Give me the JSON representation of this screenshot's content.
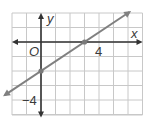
{
  "chart_data": {
    "type": "line",
    "title": "",
    "xlabel": "x",
    "ylabel": "y",
    "origin_label": "O",
    "xlim": [
      -2,
      7
    ],
    "ylim": [
      -5,
      2
    ],
    "grid": true,
    "x_tick_labels": [
      {
        "value": 4,
        "label": "4"
      }
    ],
    "y_tick_labels": [
      {
        "value": -4,
        "label": "−4"
      }
    ],
    "series": [
      {
        "name": "line",
        "equation": "y = (2/3)x - 2",
        "slope": 0.6667,
        "intercept": -2,
        "x": [
          -2,
          7
        ],
        "y": [
          -3.33,
          2.67
        ],
        "points": [
          {
            "x": 0,
            "y": -2
          },
          {
            "x": 3,
            "y": 0
          }
        ],
        "arrows": "both"
      }
    ],
    "colors": {
      "grid": "#c8c8c8",
      "axis": "#333333",
      "line": "#808080",
      "point": "#7a7a7a"
    }
  },
  "labels": {
    "x_axis": "x",
    "y_axis": "y",
    "origin": "O",
    "x_tick_4": "4",
    "y_tick_neg4": "−4"
  }
}
